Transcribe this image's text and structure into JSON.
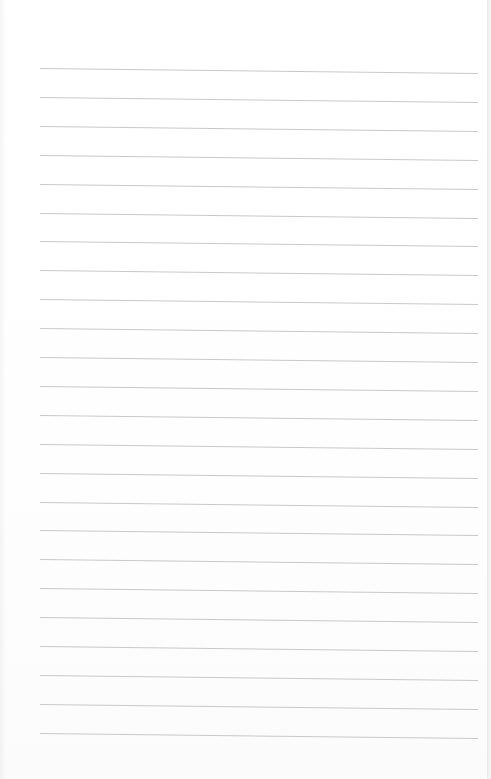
{
  "document": {
    "type": "blank lined paper",
    "text": "",
    "rule_color": "#c9c9c9",
    "paper_color": "#ffffff",
    "rules": {
      "count": 24,
      "left_x": 40,
      "right_x": 478,
      "first_y": 68,
      "spacing": 28.9,
      "tilt_deg": 0.65
    }
  }
}
